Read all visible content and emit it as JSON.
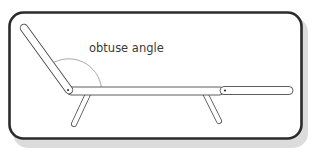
{
  "diagram": {
    "annotation": {
      "text": "obtuse angle"
    },
    "colors": {
      "frame_border": "#2b2b2b",
      "frame_shadow": "#d6d6d6",
      "frame_fill": "#ffffff",
      "line": "#4a4a4a",
      "arc": "#9a9a9a",
      "text": "#3a3a3a"
    },
    "parts": [
      "back-rest",
      "seat",
      "leg-rest",
      "front-leg",
      "rear-leg",
      "hinge-pivot-back",
      "hinge-pivot-leg"
    ]
  }
}
